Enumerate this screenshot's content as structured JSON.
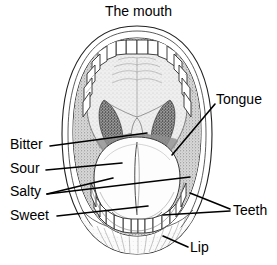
{
  "figure": {
    "title": "The mouth",
    "type": "anatomical-diagram",
    "background_color": "#ffffff",
    "ink_color": "#000000",
    "labels": [
      {
        "key": "bitter",
        "text": "Bitter",
        "side": "left",
        "x": 10,
        "y": 137
      },
      {
        "key": "sour",
        "text": "Sour",
        "side": "left",
        "x": 10,
        "y": 161
      },
      {
        "key": "salty",
        "text": "Salty",
        "side": "left",
        "x": 10,
        "y": 184
      },
      {
        "key": "sweet",
        "text": "Sweet",
        "side": "left",
        "x": 10,
        "y": 208
      },
      {
        "key": "tongue",
        "text": "Tongue",
        "side": "right",
        "x": 216,
        "y": 92
      },
      {
        "key": "teeth",
        "text": "Teeth",
        "side": "right",
        "x": 233,
        "y": 203
      },
      {
        "key": "lip",
        "text": "Lip",
        "side": "right",
        "x": 190,
        "y": 240
      }
    ],
    "parts": [
      "upper lip",
      "lower lip",
      "hard palate",
      "soft palate",
      "uvula",
      "upper teeth",
      "lower teeth",
      "tongue"
    ],
    "taste_regions": [
      "Bitter",
      "Sour",
      "Salty",
      "Sweet"
    ]
  }
}
